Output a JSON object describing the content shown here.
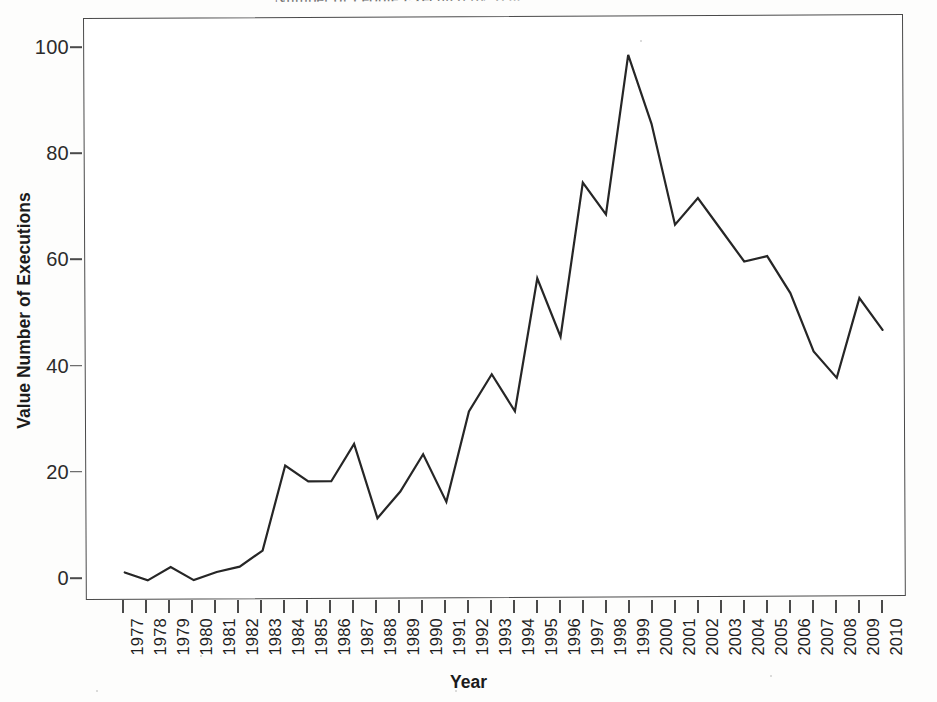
{
  "document": {
    "title_fragment": "Number of People Executed by Year"
  },
  "chart_data": {
    "type": "line",
    "title": "Number of People Executed by Year",
    "xlabel": "Year",
    "ylabel": "Value Number of Executions",
    "xlim": [
      1977,
      2010
    ],
    "ylim": [
      0,
      104
    ],
    "ytick_labels": [
      "0",
      "20",
      "40",
      "60",
      "80",
      "100"
    ],
    "yticks": [
      0,
      20,
      40,
      60,
      80,
      100
    ],
    "grid": false,
    "legend": false,
    "line_color": "#262626",
    "categories": [
      "1977",
      "1978",
      "1979",
      "1980",
      "1981",
      "1982",
      "1983",
      "1984",
      "1985",
      "1986",
      "1987",
      "1988",
      "1989",
      "1990",
      "1991",
      "1992",
      "1993",
      "1994",
      "1995",
      "1996",
      "1997",
      "1998",
      "1999",
      "2000",
      "2001",
      "2002",
      "2003",
      "2004",
      "2005",
      "2006",
      "2007",
      "2008",
      "2009",
      "2010"
    ],
    "values": [
      1,
      -0.5,
      2,
      -0.5,
      1,
      2,
      5,
      21,
      18,
      18,
      25,
      11,
      16,
      23,
      14,
      31,
      38,
      31,
      56,
      45,
      74,
      68,
      98,
      85,
      66,
      71,
      65,
      59,
      60,
      53,
      42,
      37,
      52,
      46
    ],
    "series": [
      {
        "name": "Executions",
        "values": [
          1,
          -0.5,
          2,
          -0.5,
          1,
          2,
          5,
          21,
          18,
          18,
          25,
          11,
          16,
          23,
          14,
          31,
          38,
          31,
          56,
          45,
          74,
          68,
          98,
          85,
          66,
          71,
          65,
          59,
          60,
          53,
          42,
          37,
          52,
          46
        ]
      }
    ]
  }
}
